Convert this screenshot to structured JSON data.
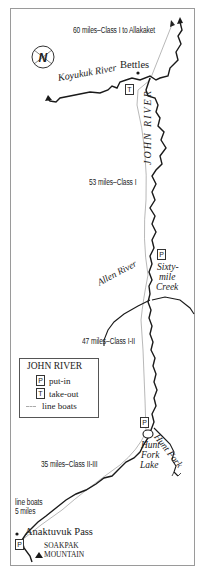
{
  "map": {
    "title": "JOHN RIVER",
    "river_label": "JOHN RIVER",
    "compass": {
      "symbol": "N"
    },
    "places": {
      "bettles": "Bettles",
      "anaktuvuk_pass": "Anaktuvuk Pass",
      "soakpak_line1": "SOAKPAK",
      "soakpak_line2": "MOUNTAIN",
      "hunt_fork_lake_line1": "Hunt",
      "hunt_fork_lake_line2": "Fork",
      "hunt_fork_lake_line3": "Lake"
    },
    "rivers": {
      "koyukuk": "Koyukuk River",
      "allen": "Allen River",
      "sixtymile_line1": "Sixty-",
      "sixtymile_line2": "mile",
      "sixtymile_line3": "Creek",
      "hunt_fork": "Hunt Fork"
    },
    "segments": {
      "seg1": "60 miles–Class I to Allakaket",
      "seg2": "53 miles–Class I",
      "seg3": "47 miles–Class I-II",
      "seg4": "35 miles–Class II-III",
      "line_boats_line1": "line boats",
      "line_boats_line2": "5 miles"
    },
    "markers": {
      "put_in": "P",
      "take_out": "T"
    },
    "legend": {
      "title": "JOHN RIVER",
      "items": [
        {
          "symbol": "P",
          "label": "put-in"
        },
        {
          "symbol": "T",
          "label": "take-out"
        },
        {
          "symbol": "---",
          "label": "line boats"
        }
      ]
    },
    "colors": {
      "river": "#1a1a1a",
      "trail": "#9a9a9a",
      "frame": "#9a9a9a"
    }
  }
}
